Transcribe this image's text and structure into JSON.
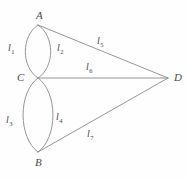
{
  "figure": {
    "type": "graph-diagram",
    "background_color": "#fefefe",
    "stroke_color": "#8a8a8a",
    "label_color": "#4a4a4a"
  },
  "vertices": [
    {
      "id": "A",
      "label": "A",
      "x": 38,
      "y": 25,
      "label_x": 36,
      "label_y": 10
    },
    {
      "id": "B",
      "label": "B",
      "x": 38,
      "y": 152,
      "label_x": 35,
      "label_y": 157
    },
    {
      "id": "C",
      "label": "C",
      "x": 38,
      "y": 78,
      "label_x": 17,
      "label_y": 72
    },
    {
      "id": "D",
      "label": "D",
      "x": 168,
      "y": 78,
      "label_x": 174,
      "label_y": 72
    }
  ],
  "edges": [
    {
      "id": "l1",
      "base": "l",
      "sub": "1",
      "from": "A",
      "to": "C",
      "shape": "arc-left",
      "label_x": 8,
      "label_y": 43
    },
    {
      "id": "l2",
      "base": "l",
      "sub": "2",
      "from": "A",
      "to": "C",
      "shape": "arc-right",
      "label_x": 57,
      "label_y": 43
    },
    {
      "id": "l3",
      "base": "l",
      "sub": "3",
      "from": "C",
      "to": "B",
      "shape": "arc-left",
      "label_x": 6,
      "label_y": 115
    },
    {
      "id": "l4",
      "base": "l",
      "sub": "4",
      "from": "C",
      "to": "B",
      "shape": "arc-right",
      "label_x": 56,
      "label_y": 112
    },
    {
      "id": "l5",
      "base": "l",
      "sub": "5",
      "from": "A",
      "to": "D",
      "shape": "straight",
      "label_x": 97,
      "label_y": 36
    },
    {
      "id": "l6",
      "base": "l",
      "sub": "6",
      "from": "C",
      "to": "D",
      "shape": "straight",
      "label_x": 86,
      "label_y": 62
    },
    {
      "id": "l7",
      "base": "l",
      "sub": "7",
      "from": "B",
      "to": "D",
      "shape": "straight",
      "label_x": 87,
      "label_y": 129
    }
  ]
}
